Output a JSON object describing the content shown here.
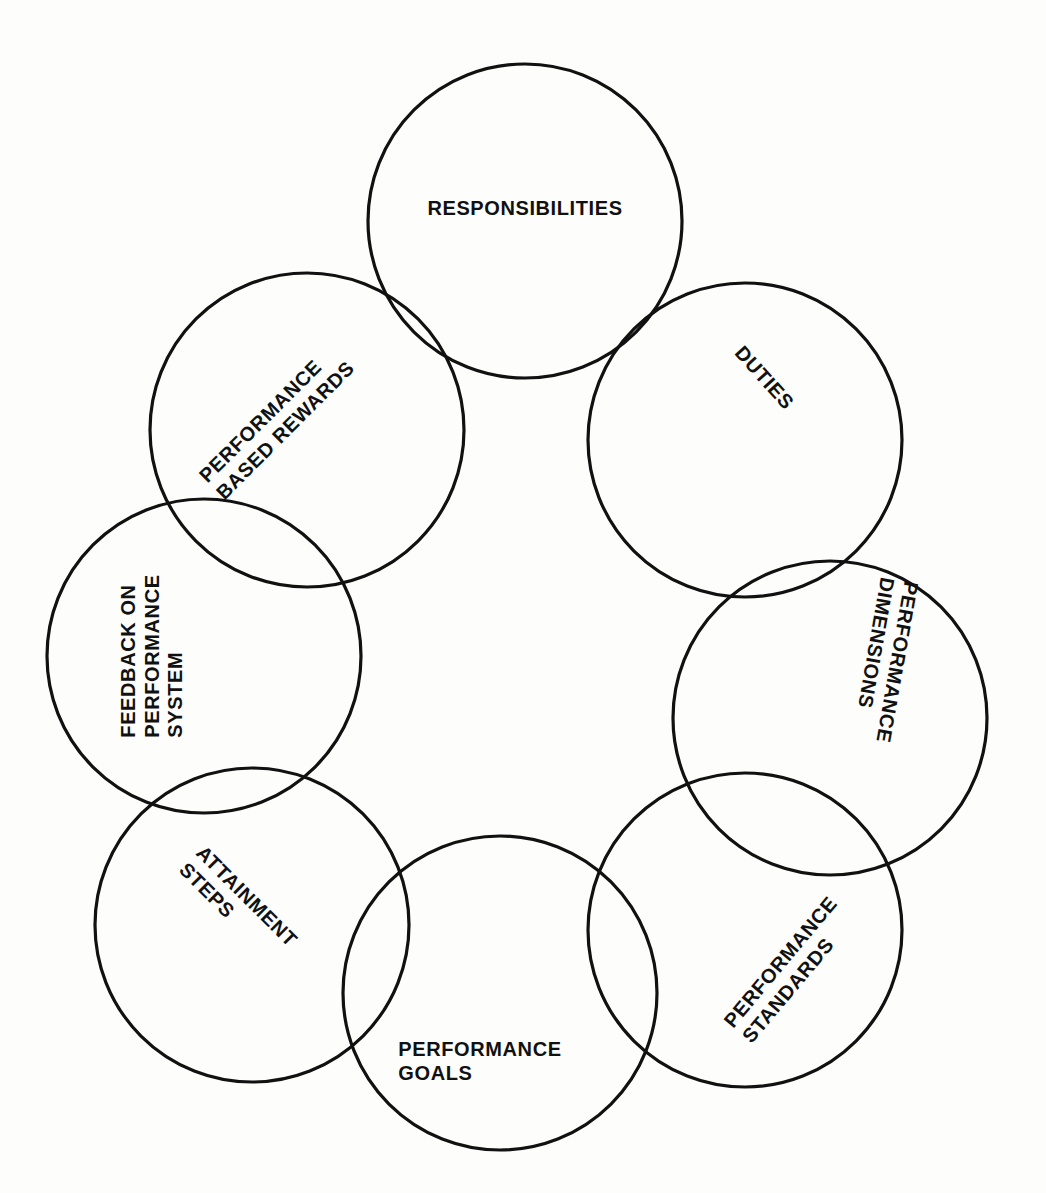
{
  "diagram": {
    "type": "overlapping-circle-ring",
    "stroke_color": "#111111",
    "background_color": "#fdfdfc",
    "circle_radius": 157,
    "ring_radius": 300,
    "ring_center": {
      "x": 520,
      "y": 660
    },
    "node_count": 8,
    "nodes": [
      {
        "id": "responsibilities",
        "label": "RESPONSIBILITIES",
        "lines": [
          "RESPONSIBILITIES"
        ],
        "cx": 525,
        "cy": 221,
        "r": 157,
        "rotation": 0,
        "label_x": 525,
        "label_y": 209,
        "ring_angle_deg": 90
      },
      {
        "id": "duties",
        "label": "DUTIES",
        "lines": [
          "DUTIES"
        ],
        "cx": 745,
        "cy": 440,
        "r": 157,
        "rotation": 48,
        "label_x": 764,
        "label_y": 378,
        "ring_angle_deg": 45
      },
      {
        "id": "performance-dimensions",
        "label": "PERFORMANCE DIMENSIONS",
        "lines": [
          "PERFORMANCE",
          "DIMENSIONS"
        ],
        "cx": 830,
        "cy": 718,
        "r": 157,
        "rotation": 100,
        "label_x": 885,
        "label_y": 660,
        "ring_angle_deg": 0
      },
      {
        "id": "performance-standards",
        "label": "PERFORMANCE STANDARDS",
        "lines": [
          "PERFORMANCE",
          "STANDARDS"
        ],
        "cx": 745,
        "cy": 930,
        "r": 157,
        "rotation": -50,
        "label_x": 790,
        "label_y": 970,
        "ring_angle_deg": -48
      },
      {
        "id": "performance-goals",
        "label": "PERFORMANCE GOALS",
        "lines": [
          "PERFORMANCE",
          "GOALS"
        ],
        "cx": 500,
        "cy": 993,
        "r": 157,
        "rotation": 0,
        "label_x": 480,
        "label_y": 1062,
        "ring_angle_deg": -95
      },
      {
        "id": "attainment-steps",
        "label": "ATTAINMENT STEPS",
        "lines": [
          "ATTAINMENT",
          "STEPS"
        ],
        "cx": 252,
        "cy": 925,
        "r": 157,
        "rotation": 45,
        "label_x": 238,
        "label_y": 905,
        "ring_angle_deg": -138
      },
      {
        "id": "feedback-on-performance-system",
        "label": "FEEDBACK ON PERFORMANCE SYSTEM",
        "lines": [
          "FEEDBACK ON",
          "PERFORMANCE",
          "SYSTEM"
        ],
        "cx": 204,
        "cy": 656,
        "r": 157,
        "rotation": -90,
        "label_x": 152,
        "label_y": 656,
        "ring_angle_deg": 180
      },
      {
        "id": "performance-based-rewards",
        "label": "PERFORMANCE BASED REWARDS",
        "lines": [
          "PERFORMANCE",
          "BASED REWARDS"
        ],
        "cx": 307,
        "cy": 430,
        "r": 157,
        "rotation": -45,
        "label_x": 277,
        "label_y": 422,
        "ring_angle_deg": 133
      }
    ]
  }
}
